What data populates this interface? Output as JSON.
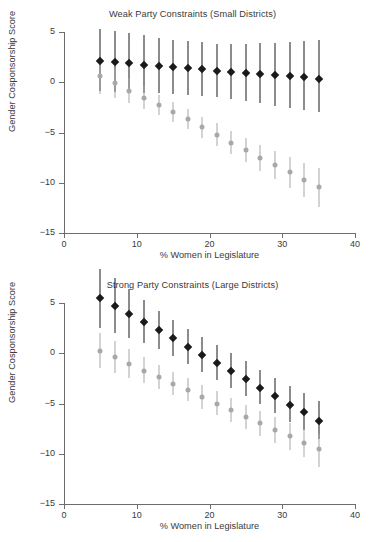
{
  "figure": {
    "xlabel": "% Women in Legislature",
    "ylabel": "Gender Cosponsorship Score"
  },
  "chart_data": [
    {
      "type": "scatter",
      "title": "Weak Party Constraints (Small Districts)",
      "xlabel": "% Women in Legislature",
      "ylabel": "Gender Cosponsorship Score",
      "xlim": [
        0,
        40
      ],
      "ylim": [
        -15,
        5
      ],
      "xticks": [
        0,
        10,
        20,
        30,
        40
      ],
      "xtick_labels": [
        "0",
        "10",
        "20",
        "30",
        "40"
      ],
      "yticks": [
        5,
        0,
        -5,
        -10,
        -15
      ],
      "ytick_labels": [
        "5",
        "0",
        "-5",
        "-10",
        "-15"
      ],
      "grid": false,
      "legend": "none",
      "x": [
        5,
        7,
        9,
        11,
        13,
        15,
        17,
        19,
        21,
        23,
        25,
        27,
        29,
        31,
        33,
        35
      ],
      "series": [
        {
          "name": "dark",
          "color": "#1a1a1a",
          "marker": "diamond",
          "values": [
            2.1,
            2.0,
            1.9,
            1.75,
            1.6,
            1.5,
            1.4,
            1.3,
            1.15,
            1.05,
            0.95,
            0.85,
            0.7,
            0.6,
            0.5,
            0.35
          ],
          "ci_low": [
            -0.9,
            -1.0,
            -1.0,
            -1.1,
            -1.1,
            -1.2,
            -1.3,
            -1.4,
            -1.5,
            -1.7,
            -1.9,
            -2.1,
            -2.4,
            -2.6,
            -2.8,
            -3.0
          ],
          "ci_high": [
            5.3,
            5.1,
            4.9,
            4.7,
            4.4,
            4.2,
            4.1,
            4.0,
            3.8,
            3.8,
            3.8,
            3.9,
            3.9,
            4.0,
            4.1,
            4.2
          ]
        },
        {
          "name": "light",
          "color": "#a8a8a8",
          "marker": "circle",
          "values": [
            0.6,
            -0.1,
            -0.85,
            -1.55,
            -2.3,
            -3.0,
            -3.7,
            -4.5,
            -5.2,
            -6.0,
            -6.7,
            -7.5,
            -8.2,
            -8.9,
            -9.7,
            -10.4
          ],
          "ci_low": [
            -1.2,
            -1.6,
            -2.1,
            -2.7,
            -3.3,
            -4.0,
            -4.7,
            -5.5,
            -6.3,
            -7.1,
            -7.9,
            -8.8,
            -9.6,
            -10.5,
            -11.4,
            -12.4
          ],
          "ci_high": [
            2.3,
            1.4,
            0.4,
            -0.4,
            -1.3,
            -2.0,
            -2.7,
            -3.5,
            -4.1,
            -4.9,
            -5.5,
            -6.2,
            -6.8,
            -7.4,
            -8.0,
            -8.5
          ]
        }
      ]
    },
    {
      "type": "scatter",
      "title": "Strong Party Constraints (Large Districts)",
      "xlabel": "% Women in Legislature",
      "ylabel": "Gender Cosponsorship Score",
      "xlim": [
        0,
        40
      ],
      "ylim": [
        -15,
        5
      ],
      "xticks": [
        0,
        10,
        20,
        30,
        40
      ],
      "xtick_labels": [
        "0",
        "10",
        "20",
        "30",
        "40"
      ],
      "yticks": [
        5,
        0,
        -5,
        -10,
        -15
      ],
      "ytick_labels": [
        "5",
        "0",
        "-5",
        "-10",
        "-15"
      ],
      "grid": false,
      "legend": "none",
      "x": [
        5,
        7,
        9,
        11,
        13,
        15,
        17,
        19,
        21,
        23,
        25,
        27,
        29,
        31,
        33,
        35
      ],
      "series": [
        {
          "name": "dark",
          "color": "#1a1a1a",
          "marker": "diamond",
          "values": [
            5.5,
            4.75,
            3.9,
            3.1,
            2.3,
            1.5,
            0.6,
            -0.15,
            -0.95,
            -1.8,
            -2.6,
            -3.45,
            -4.25,
            -5.1,
            -5.85,
            -6.7
          ],
          "ci_low": [
            2.5,
            2.0,
            1.5,
            1.0,
            0.4,
            -0.3,
            -1.1,
            -1.9,
            -2.7,
            -3.5,
            -4.3,
            -5.1,
            -5.9,
            -6.8,
            -7.6,
            -8.5
          ],
          "ci_high": [
            8.4,
            7.5,
            6.4,
            5.3,
            4.2,
            3.3,
            2.4,
            1.6,
            0.8,
            0.0,
            -0.8,
            -1.7,
            -2.5,
            -3.3,
            -4.0,
            -4.8
          ]
        },
        {
          "name": "light",
          "color": "#a8a8a8",
          "marker": "circle",
          "values": [
            0.25,
            -0.4,
            -1.1,
            -1.75,
            -2.4,
            -3.05,
            -3.65,
            -4.35,
            -5.0,
            -5.65,
            -6.3,
            -6.95,
            -7.6,
            -8.25,
            -8.9,
            -9.55
          ],
          "ci_low": [
            -1.5,
            -2.0,
            -2.5,
            -3.0,
            -3.6,
            -4.2,
            -4.8,
            -5.5,
            -6.1,
            -6.8,
            -7.5,
            -8.2,
            -8.9,
            -9.6,
            -10.3,
            -11.3
          ],
          "ci_high": [
            2.0,
            1.2,
            0.4,
            -0.4,
            -1.2,
            -1.9,
            -2.5,
            -3.2,
            -3.8,
            -4.5,
            -5.1,
            -5.7,
            -6.3,
            -6.9,
            -7.5,
            -8.0
          ]
        }
      ]
    }
  ]
}
